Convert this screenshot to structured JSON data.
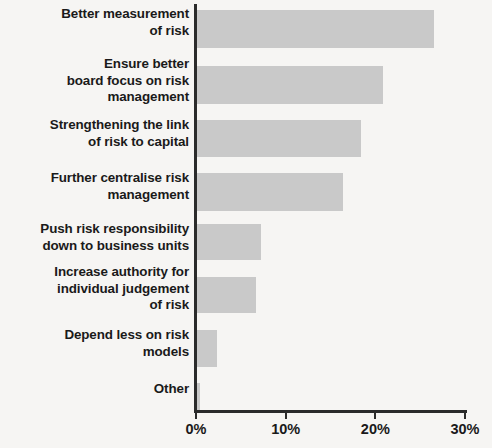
{
  "chart_data": {
    "type": "bar",
    "orientation": "horizontal",
    "title": "",
    "subtitle": "",
    "xlabel": "",
    "ylabel": "",
    "xlim": [
      0,
      30
    ],
    "grid": false,
    "legend": null,
    "bar_color": "#c9c9c9",
    "axis_color": "#2b2b2b",
    "background_color": "#f6f5f3",
    "text_color": "#1a1a1a",
    "value_unit": "%",
    "categories": [
      "Better measurement\nof risk",
      "Ensure better\nboard focus on risk\nmanagement",
      "Strengthening the link\nof risk to capital",
      "Further centralise risk\nmanagement",
      "Push risk responsibility\ndown to business units",
      "Increase authority for\nindividual judgement\nof risk",
      "Depend less on risk\nmodels",
      "Other"
    ],
    "values": [
      26.5,
      20.8,
      18.4,
      16.4,
      7.3,
      6.7,
      2.3,
      0.5
    ],
    "xticks": [
      0,
      10,
      20,
      30
    ],
    "xticklabels": [
      "0%",
      "10%",
      "20%",
      "30%"
    ]
  },
  "layout": {
    "rows": [
      {
        "label_top": 6,
        "label_lines": 2,
        "bar_top": 10,
        "bar_height": 38
      },
      {
        "label_top": 56,
        "label_lines": 3,
        "bar_top": 66,
        "bar_height": 38
      },
      {
        "label_top": 117,
        "label_lines": 2,
        "bar_top": 120,
        "bar_height": 37
      },
      {
        "label_top": 170,
        "label_lines": 2,
        "bar_top": 173,
        "bar_height": 38
      },
      {
        "label_top": 221,
        "label_lines": 2,
        "bar_top": 224,
        "bar_height": 36
      },
      {
        "label_top": 264,
        "label_lines": 3,
        "bar_top": 277,
        "bar_height": 36
      },
      {
        "label_top": 327,
        "label_lines": 2,
        "bar_top": 330,
        "bar_height": 37
      },
      {
        "label_top": 381,
        "label_lines": 1,
        "bar_top": 383,
        "bar_height": 27
      }
    ],
    "px_per_percent": 8.9667,
    "axis_origin_x": 196
  }
}
